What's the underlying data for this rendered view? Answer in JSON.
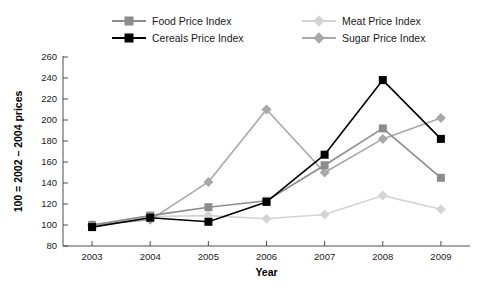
{
  "chart_data": {
    "type": "line",
    "title": "",
    "xlabel": "Year",
    "ylabel": "100 = 2002 – 2004 prices",
    "categories": [
      "2003",
      "2004",
      "2005",
      "2006",
      "2007",
      "2008",
      "2009"
    ],
    "x": [
      2003,
      2004,
      2005,
      2006,
      2007,
      2008,
      2009
    ],
    "xlim": [
      2002.5,
      2009.5
    ],
    "ylim": [
      80,
      260
    ],
    "ytick_values": [
      80,
      100,
      120,
      140,
      160,
      180,
      200,
      220,
      240,
      260
    ],
    "ytick_labels": [
      "80",
      "100",
      "120",
      "140",
      "160",
      "180",
      "200",
      "220",
      "240",
      "260"
    ],
    "xtick_labels": [
      "2003",
      "2004",
      "2005",
      "2006",
      "2007",
      "2008",
      "2009"
    ],
    "grid": false,
    "legend_position": "top",
    "series": [
      {
        "name": "Food Price Index",
        "color": "#8c8c8c",
        "marker": "square",
        "values": [
          100,
          109,
          117,
          123,
          157,
          192,
          145
        ]
      },
      {
        "name": "Cereals Price Index",
        "color": "#000000",
        "marker": "square",
        "values": [
          98,
          107,
          103,
          122,
          167,
          238,
          182
        ]
      },
      {
        "name": "Meat Price Index",
        "color": "#d4d4d4",
        "marker": "diamond",
        "values": [
          100,
          108,
          109,
          106,
          110,
          128,
          115
        ]
      },
      {
        "name": "Sugar Price Index",
        "color": "#a8a8a8",
        "marker": "diamond",
        "values": [
          100,
          105,
          141,
          210,
          150,
          182,
          202
        ]
      }
    ]
  },
  "legend": {
    "items": [
      {
        "label": "Food Price Index",
        "color": "#8c8c8c",
        "marker": "square",
        "slot": 0
      },
      {
        "label": "Cereals Price Index",
        "color": "#000000",
        "marker": "square",
        "slot": 1
      },
      {
        "label": "Meat Price Index",
        "color": "#d4d4d4",
        "marker": "diamond",
        "slot": 2
      },
      {
        "label": "Sugar Price Index",
        "color": "#a8a8a8",
        "marker": "diamond",
        "slot": 3
      }
    ]
  },
  "axes": {
    "x_title": "Year",
    "y_title": "100 = 2002 – 2004 prices"
  }
}
